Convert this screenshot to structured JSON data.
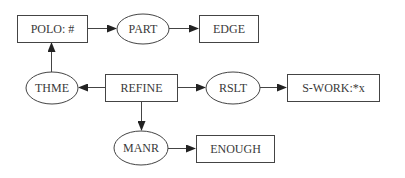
{
  "diagram": {
    "nodes": [
      {
        "id": "polo",
        "label": "POLO: #",
        "shape": "box",
        "x": 17,
        "y": 15,
        "w": 70,
        "h": 27
      },
      {
        "id": "part",
        "label": "PART",
        "shape": "ellipse",
        "cx": 143,
        "cy": 29,
        "rx": 26,
        "ry": 15
      },
      {
        "id": "edge",
        "label": "EDGE",
        "shape": "box",
        "x": 199,
        "y": 15,
        "w": 59,
        "h": 27
      },
      {
        "id": "thme",
        "label": "THME",
        "shape": "ellipse",
        "cx": 52,
        "cy": 88,
        "rx": 26,
        "ry": 16
      },
      {
        "id": "refine",
        "label": "REFINE",
        "shape": "box",
        "x": 105,
        "y": 74,
        "w": 72,
        "h": 27
      },
      {
        "id": "rslt",
        "label": "RSLT",
        "shape": "ellipse",
        "cx": 233,
        "cy": 88,
        "rx": 27,
        "ry": 16
      },
      {
        "id": "swork",
        "label": "S-WORK:*x",
        "shape": "box",
        "x": 287,
        "y": 74,
        "w": 92,
        "h": 27
      },
      {
        "id": "manr",
        "label": "MANR",
        "shape": "ellipse",
        "cx": 141,
        "cy": 148,
        "rx": 27,
        "ry": 17
      },
      {
        "id": "enough",
        "label": "ENOUGH",
        "shape": "box",
        "x": 196,
        "y": 135,
        "w": 78,
        "h": 27
      }
    ],
    "edges": [
      {
        "from": "polo",
        "to": "part"
      },
      {
        "from": "part",
        "to": "edge"
      },
      {
        "from": "thme",
        "to": "polo"
      },
      {
        "from": "refine",
        "to": "thme"
      },
      {
        "from": "refine",
        "to": "rslt"
      },
      {
        "from": "rslt",
        "to": "swork"
      },
      {
        "from": "refine",
        "to": "manr"
      },
      {
        "from": "manr",
        "to": "enough"
      }
    ],
    "colors": {
      "stroke": "#444444",
      "text": "#3a3a3a",
      "background": "#ffffff"
    }
  }
}
